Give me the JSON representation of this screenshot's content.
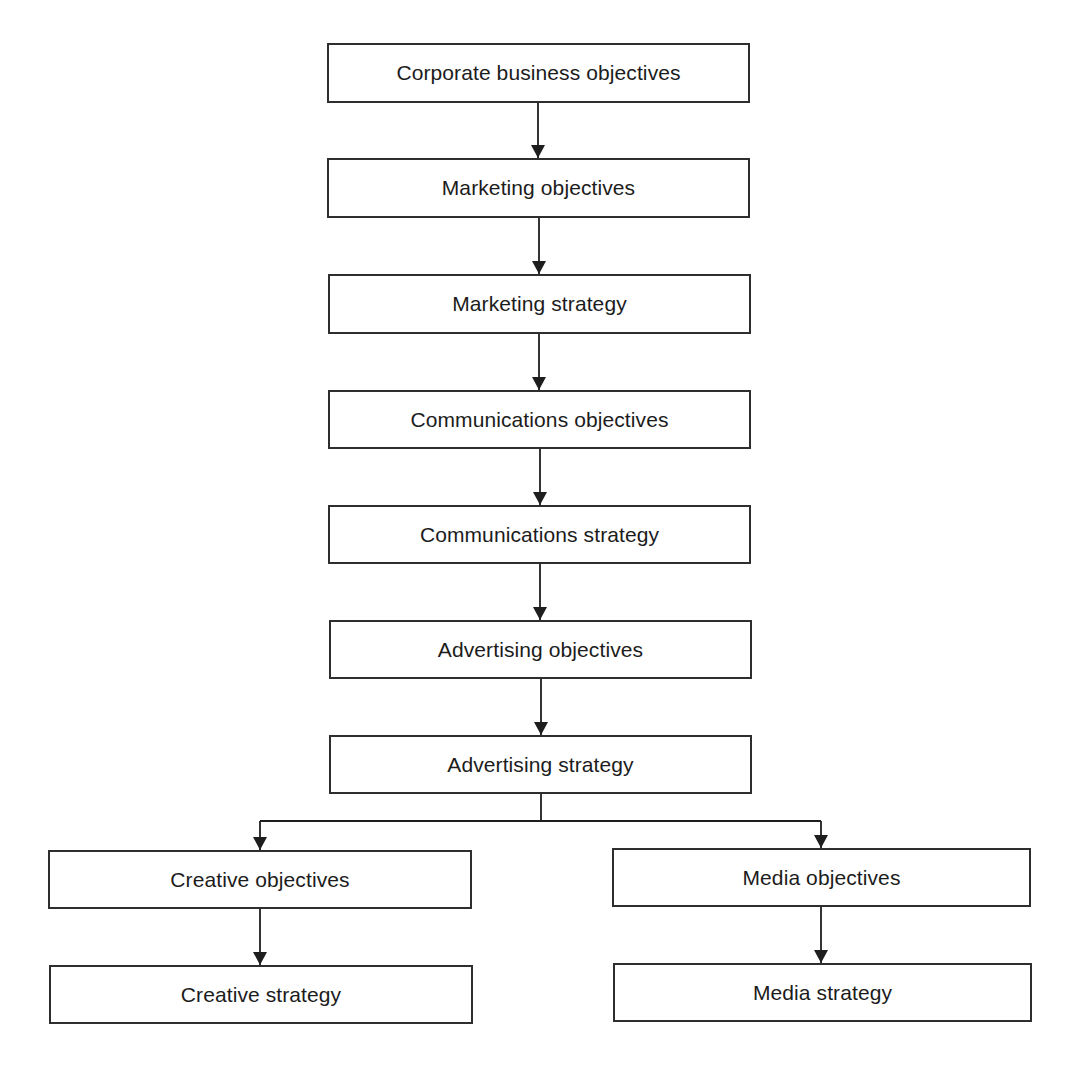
{
  "diagram": {
    "type": "flowchart",
    "colors": {
      "stroke": "#2e2e2e",
      "text": "#1c1c1c",
      "background": "#ffffff"
    },
    "nodes": [
      {
        "id": "corporate",
        "label": "Corporate business objectives"
      },
      {
        "id": "mkt_obj",
        "label": "Marketing objectives"
      },
      {
        "id": "mkt_strat",
        "label": "Marketing strategy"
      },
      {
        "id": "comm_obj",
        "label": "Communications objectives"
      },
      {
        "id": "comm_strat",
        "label": "Communications strategy"
      },
      {
        "id": "adv_obj",
        "label": "Advertising objectives"
      },
      {
        "id": "adv_strat",
        "label": "Advertising strategy"
      },
      {
        "id": "creative_obj",
        "label": "Creative objectives"
      },
      {
        "id": "creative_strat",
        "label": "Creative strategy"
      },
      {
        "id": "media_obj",
        "label": "Media objectives"
      },
      {
        "id": "media_strat",
        "label": "Media strategy"
      }
    ],
    "edges": [
      [
        "corporate",
        "mkt_obj"
      ],
      [
        "mkt_obj",
        "mkt_strat"
      ],
      [
        "mkt_strat",
        "comm_obj"
      ],
      [
        "comm_obj",
        "comm_strat"
      ],
      [
        "comm_strat",
        "adv_obj"
      ],
      [
        "adv_obj",
        "adv_strat"
      ],
      [
        "adv_strat",
        "creative_obj"
      ],
      [
        "adv_strat",
        "media_obj"
      ],
      [
        "creative_obj",
        "creative_strat"
      ],
      [
        "media_obj",
        "media_strat"
      ]
    ]
  }
}
